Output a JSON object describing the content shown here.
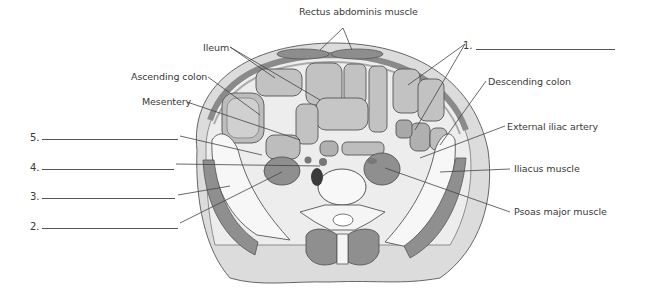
{
  "figure": {
    "labels": [
      {
        "id": "rectus",
        "text": "Rectus abdominis muscle",
        "x": 299,
        "y": 6
      },
      {
        "id": "ileum",
        "text": "Ileum",
        "x": 203,
        "y": 42
      },
      {
        "id": "ascending",
        "text": "Ascending colon",
        "x": 131,
        "y": 71
      },
      {
        "id": "mesentery",
        "text": "Mesentery",
        "x": 142,
        "y": 96
      },
      {
        "id": "descending",
        "text": "Descending colon",
        "x": 488,
        "y": 76
      },
      {
        "id": "ext_iliac",
        "text": "External iliac artery",
        "x": 507,
        "y": 121
      },
      {
        "id": "iliacus",
        "text": "Iliacus muscle",
        "x": 514,
        "y": 163
      },
      {
        "id": "psoas",
        "text": "Psoas major muscle",
        "x": 514,
        "y": 206
      }
    ],
    "blanks": [
      {
        "number": "1.",
        "nx": 463,
        "ny": 40,
        "x1": 476,
        "x2": 615,
        "y": 49
      },
      {
        "number": "5.",
        "nx": 30,
        "ny": 132,
        "x1": 42,
        "x2": 178,
        "y": 139
      },
      {
        "number": "4.",
        "nx": 30,
        "ny": 162,
        "x1": 42,
        "x2": 174,
        "y": 169
      },
      {
        "number": "3.",
        "nx": 30,
        "ny": 191,
        "x1": 42,
        "x2": 175,
        "y": 198
      },
      {
        "number": "2.",
        "nx": 30,
        "ny": 221,
        "x1": 42,
        "x2": 178,
        "y": 228
      }
    ]
  },
  "colors": {
    "skin": "#d9d9d9",
    "fat": "#ececec",
    "muscle": "#8d8d8d",
    "bowel_wall": "#9e9e9e",
    "bowel_lumen": "#c9c9c9",
    "bone": "#f7f7f7",
    "outline": "#555555",
    "leader": "#444444"
  }
}
